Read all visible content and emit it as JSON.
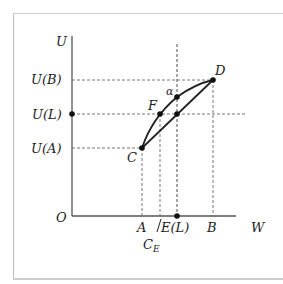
{
  "header": {
    "clipped_text": ""
  },
  "diagram": {
    "axes": {
      "y_label": "U",
      "x_label": "W",
      "origin_label": "O"
    },
    "y_ticks": [
      {
        "label": "U(B)",
        "y": 80
      },
      {
        "label": "U(L)",
        "y": 114
      },
      {
        "label": "U(A)",
        "y": 148
      }
    ],
    "x_ticks": [
      {
        "label": "A",
        "x": 142
      },
      {
        "label": "E(L)",
        "x": 177
      },
      {
        "label": "B",
        "x": 213
      }
    ],
    "ce_label": "C",
    "ce_subscript": "E",
    "points": {
      "C": {
        "label": "C",
        "x": 142,
        "y": 148
      },
      "D": {
        "label": "D",
        "x": 213,
        "y": 80
      },
      "F": {
        "label": "F",
        "x": 160,
        "y": 114
      },
      "alpha": {
        "label": "α",
        "x": 177,
        "y": 97
      },
      "chord_mid": {
        "x": 177,
        "y": 114
      }
    },
    "colors": {
      "axis": "#555555",
      "curve": "#222222",
      "dash": "#777777",
      "frame": "#c8c8c8"
    }
  }
}
